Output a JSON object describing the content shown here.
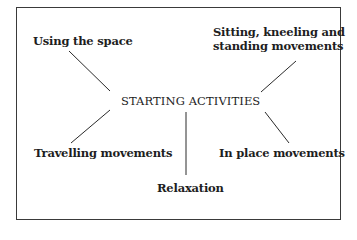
{
  "diagram": {
    "center": "STARTING ACTIVITIES",
    "nodes": {
      "using_space": "Using the space",
      "sitting_line1": "Sitting, kneeling and",
      "sitting_line2": "standing movements",
      "travelling": "Travelling movements",
      "in_place": "In place movements",
      "relaxation": "Relaxation"
    },
    "colors": {
      "ink": "#1e1e1e",
      "border": "#3a3a3a",
      "background": "#ffffff"
    }
  }
}
